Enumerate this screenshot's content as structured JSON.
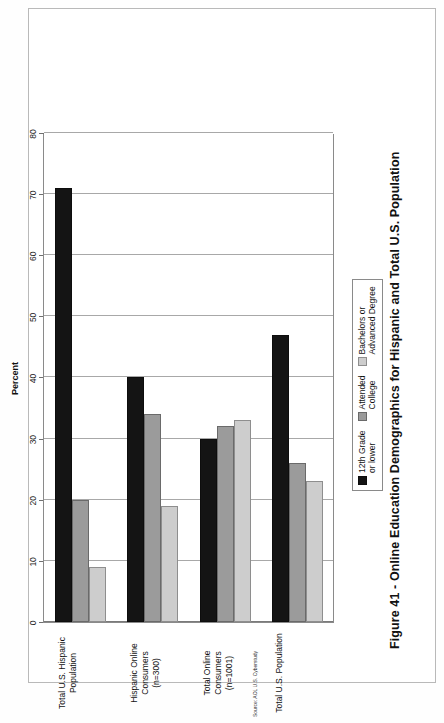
{
  "figure": {
    "title": "Figure 41 - Online Education Demographics for Hispanic and Total U.S. Population",
    "source_note": "Source: AOL U.S. Cyberstudy"
  },
  "axis": {
    "label": "Percent",
    "ticks": [
      "0",
      "10",
      "20",
      "30",
      "40",
      "50",
      "60",
      "70",
      "80"
    ]
  },
  "legend": {
    "entries": [
      {
        "swatch": "series-black-swatch",
        "line1": "12th Grade",
        "line2": "or lower"
      },
      {
        "swatch": "series-gray-swatch",
        "line1": "Attended",
        "line2": "College"
      },
      {
        "swatch": "series-light-gray-swatch",
        "line1": "Bachelors or",
        "line2": "Advanced Degree"
      }
    ]
  },
  "categories": [
    {
      "line1": "Total U.S. Hispanic",
      "line2": "Population"
    },
    {
      "line1": "Hispanic Online Consumers",
      "line2": "(n=300)"
    },
    {
      "line1": "Total Online Consumers",
      "line2": "(n=1001)"
    },
    {
      "line1": "Total U.S. Population",
      "line2": ""
    }
  ],
  "chart_data": {
    "type": "bar",
    "orientation": "horizontal",
    "title": "Figure 41 - Online Education Demographics for Hispanic and Total U.S. Population",
    "xlabel": "Percent",
    "ylabel": "",
    "xlim": [
      0,
      80
    ],
    "xticks": [
      0,
      10,
      20,
      30,
      40,
      50,
      60,
      70,
      80
    ],
    "grid": true,
    "legend_position": "bottom-right",
    "categories": [
      "Total U.S. Hispanic Population",
      "Hispanic Online Consumers (n=300)",
      "Total Online Consumers (n=1001)",
      "Total U.S. Population"
    ],
    "series": [
      {
        "name": "12th Grade or lower",
        "color": "#141414",
        "values": [
          71,
          40,
          30,
          47
        ]
      },
      {
        "name": "Attended College",
        "color": "#9b9b9b",
        "values": [
          20,
          34,
          32,
          26
        ]
      },
      {
        "name": "Bachelors or Advanced Degree",
        "color": "#cdcdcd",
        "values": [
          9,
          19,
          33,
          23
        ]
      }
    ],
    "annotations": [
      "Source: AOL U.S. Cyberstudy"
    ]
  }
}
